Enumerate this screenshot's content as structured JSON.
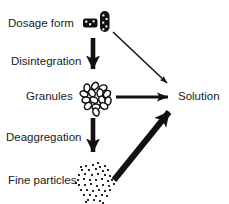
{
  "figure": {
    "background_color": "#ffffff",
    "ink_color": "#111111",
    "width": 229,
    "height": 204
  },
  "nodes": [
    {
      "id": "dosage-form",
      "label": "Dosage form",
      "label_x": 8,
      "label_y": 24,
      "icon": "tablet-and-capsule-icon"
    },
    {
      "id": "granules",
      "label": "Granules",
      "label_x": 26,
      "label_y": 97,
      "icon": "granule-cluster-icon"
    },
    {
      "id": "fine-particles",
      "label": "Fine particles",
      "label_x": 8,
      "label_y": 181,
      "icon": "fine-particle-cluster-icon"
    },
    {
      "id": "solution",
      "label": "Solution",
      "label_x": 178,
      "label_y": 97,
      "icon": "none"
    }
  ],
  "edges": [
    {
      "id": "disintegration",
      "label": "Disintegration",
      "label_x": 11,
      "label_y": 62,
      "from": "dosage-form",
      "to": "granules",
      "style": "thick-vertical-down"
    },
    {
      "id": "deaggregation",
      "label": "Deaggregation",
      "label_x": 6,
      "label_y": 138,
      "from": "granules",
      "to": "fine-particles",
      "style": "thick-vertical-down"
    },
    {
      "id": "dosage-form-to-solution",
      "label": "",
      "from": "dosage-form",
      "to": "solution",
      "style": "thin-diagonal-down-right"
    },
    {
      "id": "granules-to-solution",
      "label": "",
      "from": "granules",
      "to": "solution",
      "style": "medium-horizontal-right"
    },
    {
      "id": "fine-particles-to-solution",
      "label": "",
      "from": "fine-particles",
      "to": "solution",
      "style": "very-thick-diagonal-up-right"
    }
  ],
  "granule_cluster": {
    "count": 15,
    "center_x": 96,
    "center_y": 97,
    "radius_x": 4.0,
    "radius_y": 3.0,
    "positions": [
      [
        87,
        88
      ],
      [
        95,
        86
      ],
      [
        103,
        88
      ],
      [
        84,
        94
      ],
      [
        92,
        93
      ],
      [
        100,
        93
      ],
      [
        107,
        94
      ],
      [
        86,
        100
      ],
      [
        94,
        100
      ],
      [
        102,
        100
      ],
      [
        108,
        101
      ],
      [
        88,
        106
      ],
      [
        96,
        107
      ],
      [
        104,
        106
      ],
      [
        96,
        112
      ]
    ]
  },
  "particle_cluster": {
    "count": 48,
    "center_x": 95,
    "center_y": 181,
    "dot_size": 1.9,
    "positions": [
      [
        86,
        166
      ],
      [
        93,
        165
      ],
      [
        100,
        167
      ],
      [
        82,
        170
      ],
      [
        89,
        170
      ],
      [
        96,
        169
      ],
      [
        103,
        171
      ],
      [
        108,
        170
      ],
      [
        79,
        175
      ],
      [
        85,
        174
      ],
      [
        92,
        175
      ],
      [
        98,
        174
      ],
      [
        105,
        175
      ],
      [
        110,
        176
      ],
      [
        78,
        180
      ],
      [
        84,
        179
      ],
      [
        90,
        180
      ],
      [
        96,
        180
      ],
      [
        102,
        179
      ],
      [
        108,
        181
      ],
      [
        112,
        180
      ],
      [
        79,
        185
      ],
      [
        85,
        185
      ],
      [
        91,
        184
      ],
      [
        97,
        186
      ],
      [
        103,
        185
      ],
      [
        109,
        186
      ],
      [
        81,
        190
      ],
      [
        87,
        190
      ],
      [
        93,
        191
      ],
      [
        99,
        190
      ],
      [
        105,
        191
      ],
      [
        110,
        190
      ],
      [
        84,
        195
      ],
      [
        90,
        195
      ],
      [
        96,
        196
      ],
      [
        102,
        195
      ],
      [
        107,
        196
      ],
      [
        88,
        200
      ],
      [
        94,
        200
      ],
      [
        100,
        201
      ],
      [
        81,
        167
      ],
      [
        105,
        166
      ],
      [
        76,
        183
      ],
      [
        114,
        184
      ],
      [
        86,
        202
      ],
      [
        103,
        203
      ],
      [
        98,
        163
      ]
    ]
  }
}
